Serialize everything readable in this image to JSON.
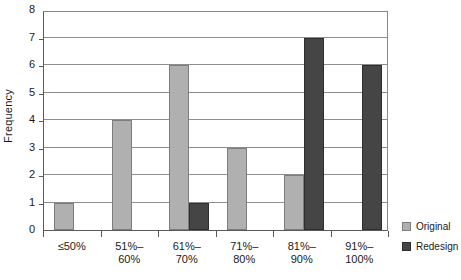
{
  "chart_data": {
    "type": "bar",
    "title": "",
    "xlabel": "",
    "ylabel": "Frequency",
    "ylim": [
      0,
      8
    ],
    "yticks": [
      0,
      1,
      2,
      3,
      4,
      5,
      6,
      7,
      8
    ],
    "grid": true,
    "legend_position": "right",
    "categories": [
      "≤50%",
      "51%–\n60%",
      "61%–\n70%",
      "71%–\n80%",
      "81%–\n90%",
      "91%–\n100%"
    ],
    "series": [
      {
        "name": "Original",
        "color": "#b0b0b0",
        "values": [
          1,
          4,
          6,
          3,
          2,
          0
        ]
      },
      {
        "name": "Redesign",
        "color": "#454545",
        "values": [
          0,
          0,
          1,
          0,
          7,
          6
        ]
      }
    ]
  },
  "legend": {
    "items": [
      {
        "label": "Original",
        "swatch": "original"
      },
      {
        "label": "Redesign",
        "swatch": "redesign"
      }
    ]
  }
}
